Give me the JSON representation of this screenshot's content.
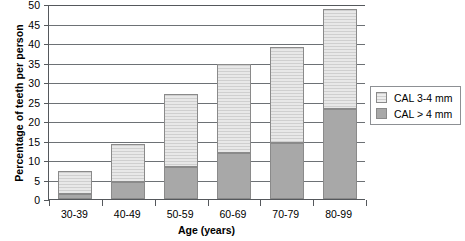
{
  "chart_data": {
    "type": "bar",
    "subtype": "stacked-bar-vertical",
    "title": "",
    "xlabel": "Age (years)",
    "ylabel": "Percentage of teeth per person",
    "categories": [
      "30-39",
      "40-49",
      "50-59",
      "60-69",
      "70-79",
      "80-99"
    ],
    "series": [
      {
        "name": "CAL > 4 mm",
        "values": [
          1.4,
          4.3,
          8.3,
          11.7,
          14.4,
          23.0
        ],
        "color": "#a8a8a8"
      },
      {
        "name": "CAL 3-4 mm",
        "values": [
          5.9,
          9.7,
          18.7,
          22.9,
          24.6,
          25.7
        ],
        "color": "#e0e0e0"
      }
    ],
    "totals": [
      7.3,
      14.0,
      27.0,
      34.6,
      39.0,
      48.7
    ],
    "ylim": [
      0,
      50
    ],
    "ytick_step": 5,
    "ytick_labels": [
      "0",
      "5",
      "10",
      "15",
      "20",
      "25",
      "30",
      "35",
      "40",
      "45",
      "50"
    ],
    "grid": true,
    "grid_axis": "y",
    "legend_position": "right"
  },
  "legend": {
    "entries": [
      {
        "label": "CAL 3-4 mm",
        "swatch": "high"
      },
      {
        "label": "CAL > 4 mm",
        "swatch": "low"
      }
    ]
  }
}
